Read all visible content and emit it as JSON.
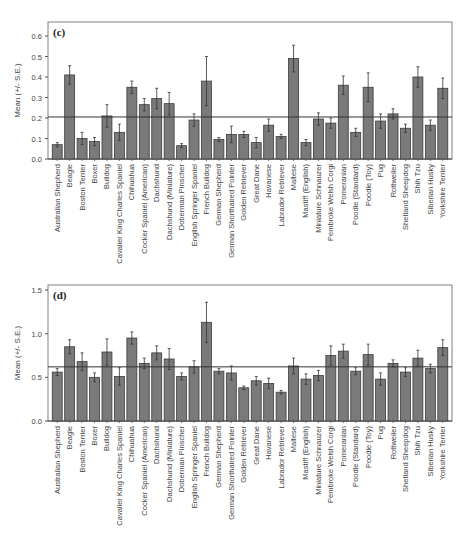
{
  "figure": {
    "ylabel": "Mean (+/- S.E.)"
  },
  "chart_data": [
    {
      "type": "bar",
      "panel_label": "(c)",
      "title": "",
      "xlabel": "",
      "ylabel": "Mean (+/- S.E.)",
      "ylim": [
        0.0,
        0.65
      ],
      "yticks": [
        "0.0",
        "0.1",
        "0.2",
        "0.3",
        "0.4",
        "0.5",
        "0.6"
      ],
      "reference_line": 0.205,
      "grid": false,
      "legend": null,
      "categories": [
        "Australian Shepherd",
        "Beagle",
        "Boston Terrier",
        "Boxer",
        "Bulldog",
        "Cavalier King Charles Spaniel",
        "Chihuahua",
        "Cocker Spaniel (American)",
        "Dachshund",
        "Dachshund (Miniature)",
        "Doberman Pinscher",
        "English Springer Spaniel",
        "French Bulldog",
        "German Shepherd",
        "German Shorthaired Pointer",
        "Golden Retriever",
        "Great Dane",
        "Havanese",
        "Labrador Retriever",
        "Maltese",
        "Mastiff (English)",
        "Miniature Schnauzer",
        "Pembroke Welsh Corgi",
        "Pomeranian",
        "Poodle (Standard)",
        "Poodle (Toy)",
        "Pug",
        "Rottweiler",
        "Shetland Sheepdog",
        "Shih Tzu",
        "Siberian Husky",
        "Yorkshire Terrier"
      ],
      "values": [
        0.07,
        0.41,
        0.1,
        0.085,
        0.21,
        0.13,
        0.35,
        0.265,
        0.295,
        0.27,
        0.065,
        0.19,
        0.38,
        0.095,
        0.12,
        0.12,
        0.08,
        0.165,
        0.11,
        0.49,
        0.08,
        0.195,
        0.175,
        0.36,
        0.13,
        0.35,
        0.185,
        0.22,
        0.15,
        0.4,
        0.165,
        0.345
      ],
      "errors": [
        0.01,
        0.045,
        0.03,
        0.02,
        0.055,
        0.04,
        0.03,
        0.03,
        0.05,
        0.055,
        0.01,
        0.03,
        0.12,
        0.01,
        0.04,
        0.015,
        0.025,
        0.03,
        0.01,
        0.065,
        0.015,
        0.03,
        0.025,
        0.045,
        0.02,
        0.07,
        0.035,
        0.025,
        0.02,
        0.05,
        0.025,
        0.05
      ]
    },
    {
      "type": "bar",
      "panel_label": "(d)",
      "title": "",
      "xlabel": "",
      "ylabel": "Mean (+/- S.E.)",
      "ylim": [
        0.0,
        1.55
      ],
      "yticks": [
        "0.0",
        "0.5",
        "1.0",
        "1.5"
      ],
      "reference_line": 0.62,
      "grid": false,
      "legend": null,
      "categories": [
        "Australian Shepherd",
        "Beagle",
        "Boston Terrier",
        "Boxer",
        "Bulldog",
        "Cavalier King Charles Spaniel",
        "Chihuahua",
        "Cocker Spaniel (American)",
        "Dachshund",
        "Dachshund (Miniature)",
        "Doberman Pinscher",
        "English Springer Spaniel",
        "French Bulldog",
        "German Shepherd",
        "German Shorthaired Pointer",
        "Golden Retriever",
        "Great Dane",
        "Havanese",
        "Labrador Retriever",
        "Maltese",
        "Mastiff (English)",
        "Miniature Schnauzer",
        "Pembroke Welsh Corgi",
        "Pomeranian",
        "Poodle (Standard)",
        "Poodle (Toy)",
        "Pug",
        "Rottweiler",
        "Shetland Sheepdog",
        "Shih Tzu",
        "Siberian Husky",
        "Yorkshire Terrier"
      ],
      "values": [
        0.56,
        0.85,
        0.68,
        0.5,
        0.79,
        0.51,
        0.95,
        0.66,
        0.78,
        0.71,
        0.51,
        0.62,
        1.13,
        0.57,
        0.55,
        0.38,
        0.46,
        0.43,
        0.33,
        0.63,
        0.48,
        0.52,
        0.75,
        0.8,
        0.57,
        0.76,
        0.48,
        0.66,
        0.56,
        0.72,
        0.6,
        0.84
      ],
      "errors": [
        0.04,
        0.08,
        0.1,
        0.05,
        0.15,
        0.1,
        0.07,
        0.06,
        0.08,
        0.12,
        0.04,
        0.07,
        0.23,
        0.03,
        0.08,
        0.02,
        0.05,
        0.06,
        0.02,
        0.09,
        0.06,
        0.06,
        0.11,
        0.08,
        0.04,
        0.12,
        0.07,
        0.04,
        0.05,
        0.09,
        0.05,
        0.09
      ]
    }
  ]
}
